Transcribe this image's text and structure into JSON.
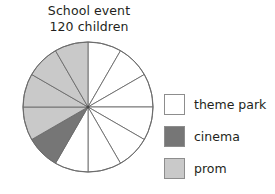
{
  "title": {
    "line1": "School event",
    "line2": "120 children"
  },
  "legend": {
    "items": [
      {
        "label": "theme park",
        "color": "#ffffff",
        "swatch_name": "legend-swatch-theme-park"
      },
      {
        "label": "cinema",
        "color": "#767676",
        "swatch_name": "legend-swatch-cinema"
      },
      {
        "label": "prom",
        "color": "#c9c9c9",
        "swatch_name": "legend-swatch-prom"
      }
    ]
  },
  "colors": {
    "outline": "#6b6b6b",
    "theme_park": "#ffffff",
    "cinema": "#767676",
    "prom": "#c9c9c9",
    "text": "#231f20"
  },
  "chart_data": {
    "type": "pie",
    "title": "School event 120 children",
    "total": 120,
    "sector_count": 12,
    "degrees_per_sector": 30,
    "children_per_sector": 10,
    "legend_position": "right",
    "start_angle_deg": 0,
    "direction": "clockwise",
    "categories": [
      "theme park",
      "cinema",
      "prom"
    ],
    "values": [
      70,
      10,
      40
    ],
    "sector_counts": [
      7,
      1,
      4
    ],
    "percentages": [
      58.3,
      8.3,
      33.3
    ],
    "sectors": [
      {
        "index": 1,
        "start_deg": 0,
        "end_deg": 30,
        "category": "theme park",
        "value": 10
      },
      {
        "index": 2,
        "start_deg": 30,
        "end_deg": 60,
        "category": "theme park",
        "value": 10
      },
      {
        "index": 3,
        "start_deg": 60,
        "end_deg": 90,
        "category": "theme park",
        "value": 10
      },
      {
        "index": 4,
        "start_deg": 90,
        "end_deg": 120,
        "category": "theme park",
        "value": 10
      },
      {
        "index": 5,
        "start_deg": 120,
        "end_deg": 150,
        "category": "theme park",
        "value": 10
      },
      {
        "index": 6,
        "start_deg": 150,
        "end_deg": 180,
        "category": "theme park",
        "value": 10
      },
      {
        "index": 7,
        "start_deg": 180,
        "end_deg": 210,
        "category": "theme park",
        "value": 10
      },
      {
        "index": 8,
        "start_deg": 210,
        "end_deg": 240,
        "category": "cinema",
        "value": 10
      },
      {
        "index": 9,
        "start_deg": 240,
        "end_deg": 270,
        "category": "prom",
        "value": 10
      },
      {
        "index": 10,
        "start_deg": 270,
        "end_deg": 300,
        "category": "prom",
        "value": 10
      },
      {
        "index": 11,
        "start_deg": 300,
        "end_deg": 330,
        "category": "prom",
        "value": 10
      },
      {
        "index": 12,
        "start_deg": 330,
        "end_deg": 360,
        "category": "prom",
        "value": 10
      }
    ]
  }
}
